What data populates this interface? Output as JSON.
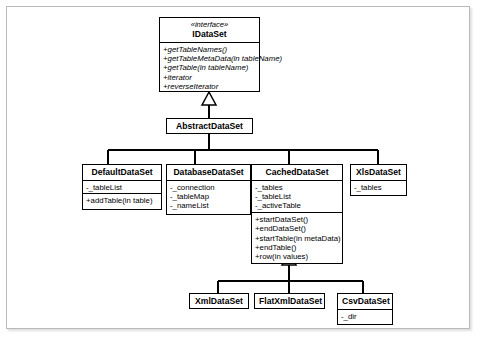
{
  "diagram": {
    "type": "uml-class-diagram",
    "colors": {
      "line": "#000000",
      "box_fill": "#ffffff",
      "frame": "#b9b9b9"
    },
    "classes": [
      {
        "id": "idataset",
        "stereotype": "«interface»",
        "name": "IDataSet",
        "attributes": [],
        "operations": [
          "+getTableNames()",
          "+getTableMetaData(in tableName)",
          "+getTable(in tableName)",
          "+iterator",
          "+reverseIterator"
        ]
      },
      {
        "id": "abstractdataset",
        "stereotype": "",
        "name": "AbstractDataSet",
        "attributes": [],
        "operations": []
      },
      {
        "id": "defaultdataset",
        "stereotype": "",
        "name": "DefaultDataSet",
        "attributes": [
          "-_tableList"
        ],
        "operations": [
          "+addTable(in table)"
        ]
      },
      {
        "id": "databasedataset",
        "stereotype": "",
        "name": "DatabaseDataSet",
        "attributes": [
          "-_connection",
          "-_tableMap",
          "-_nameList"
        ],
        "operations": []
      },
      {
        "id": "cacheddataset",
        "stereotype": "",
        "name": "CachedDataSet",
        "attributes": [
          "-_tables",
          "-_tableList",
          "-_activeTable"
        ],
        "operations": [
          "+startDataSet()",
          "+endDataSet()",
          "+startTable(in metaData)",
          "+endTable()",
          "+row(in values)"
        ]
      },
      {
        "id": "xlsdataset",
        "stereotype": "",
        "name": "XlsDataSet",
        "attributes": [
          "-_tables"
        ],
        "operations": []
      },
      {
        "id": "xmldataset",
        "stereotype": "",
        "name": "XmlDataSet",
        "attributes": [],
        "operations": []
      },
      {
        "id": "flatxmldataset",
        "stereotype": "",
        "name": "FlatXmlDataSet",
        "attributes": [],
        "operations": []
      },
      {
        "id": "csvdataset",
        "stereotype": "",
        "name": "CsvDataSet",
        "attributes": [
          "-_dir"
        ],
        "operations": []
      }
    ],
    "generalizations": [
      {
        "from": "abstractdataset",
        "to": "idataset"
      },
      {
        "from": "defaultdataset",
        "to": "abstractdataset"
      },
      {
        "from": "databasedataset",
        "to": "abstractdataset"
      },
      {
        "from": "cacheddataset",
        "to": "abstractdataset"
      },
      {
        "from": "xlsdataset",
        "to": "abstractdataset"
      },
      {
        "from": "xmldataset",
        "to": "cacheddataset"
      },
      {
        "from": "flatxmldataset",
        "to": "cacheddataset"
      },
      {
        "from": "csvdataset",
        "to": "cacheddataset"
      }
    ]
  }
}
